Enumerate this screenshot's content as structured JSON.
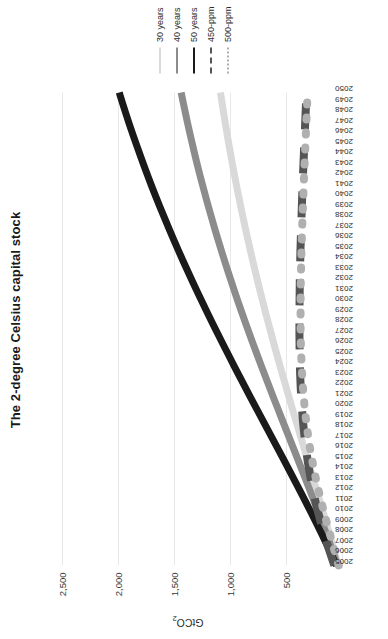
{
  "chart_data": {
    "type": "line",
    "title": "The 2-degree Celsius capital stock",
    "xlabel": "",
    "ylabel": "GtCO",
    "ylabel_sub": "2",
    "ylim": [
      0,
      2750
    ],
    "yticks": [
      0,
      500,
      1000,
      1500,
      2000,
      2500
    ],
    "ytick_labels": [
      "",
      "500",
      "1,000",
      "1,500",
      "2,000",
      "2,500"
    ],
    "grid": true,
    "legend_position": "right",
    "x": [
      2005,
      2006,
      2007,
      2008,
      2009,
      2010,
      2011,
      2012,
      2013,
      2014,
      2015,
      2016,
      2017,
      2018,
      2019,
      2020,
      2021,
      2022,
      2023,
      2024,
      2025,
      2026,
      2027,
      2028,
      2029,
      2030,
      2031,
      2032,
      2033,
      2034,
      2035,
      2036,
      2037,
      2038,
      2039,
      2040,
      2041,
      2042,
      2043,
      2044,
      2045,
      2046,
      2047,
      2048,
      2049,
      2050
    ],
    "xtick_labels": [
      "2005",
      "2006",
      "2007",
      "2008",
      "2009",
      "2010",
      "2011",
      "2012",
      "2013",
      "2014",
      "2015",
      "2016",
      "2017",
      "2018",
      "2019",
      "2020",
      "2021",
      "2022",
      "2023",
      "2024",
      "2025",
      "2026",
      "2027",
      "2028",
      "2029",
      "2030",
      "2031",
      "2032",
      "2033",
      "2034",
      "2035",
      "2036",
      "2037",
      "2038",
      "2039",
      "2040",
      "2041",
      "2042",
      "2043",
      "2044",
      "2045",
      "2046",
      "2047",
      "2048",
      "2049",
      "2050"
    ],
    "series": [
      {
        "name": "30 years",
        "color": "#d9d9d9",
        "style": "solid",
        "values": [
          35,
          60,
          86,
          112,
          139,
          166,
          194,
          222,
          250,
          278,
          306,
          334,
          362,
          390,
          418,
          446,
          473,
          500,
          527,
          554,
          580,
          606,
          631,
          656,
          681,
          705,
          729,
          752,
          775,
          797,
          819,
          840,
          861,
          881,
          901,
          920,
          939,
          957,
          975,
          992,
          1009,
          1025,
          1041,
          1056,
          1071,
          1085
        ]
      },
      {
        "name": "40 years",
        "color": "#8c8c8c",
        "style": "solid",
        "values": [
          40,
          72,
          105,
          139,
          174,
          209,
          245,
          281,
          317,
          354,
          391,
          428,
          465,
          502,
          539,
          576,
          613,
          649,
          685,
          721,
          756,
          791,
          825,
          859,
          892,
          925,
          957,
          988,
          1019,
          1049,
          1078,
          1107,
          1135,
          1162,
          1189,
          1215,
          1240,
          1265,
          1289,
          1312,
          1334,
          1356,
          1377,
          1397,
          1417,
          1436
        ]
      },
      {
        "name": "50 years",
        "color": "#1a1a1a",
        "style": "solid",
        "values": [
          50,
          92,
          136,
          181,
          227,
          274,
          322,
          370,
          419,
          468,
          517,
          567,
          617,
          667,
          717,
          767,
          817,
          866,
          915,
          964,
          1012,
          1060,
          1107,
          1154,
          1200,
          1245,
          1290,
          1334,
          1377,
          1420,
          1462,
          1503,
          1543,
          1582,
          1621,
          1659,
          1696,
          1732,
          1767,
          1801,
          1834,
          1867,
          1899,
          1930,
          1960,
          1989
        ]
      },
      {
        "name": "450-ppm",
        "color": "#555555",
        "style": "dashed",
        "values": [
          68,
          100,
          131,
          160,
          187,
          212,
          235,
          256,
          275,
          292,
          307,
          320,
          332,
          342,
          351,
          358,
          364,
          369,
          373,
          376,
          378,
          379,
          380,
          380,
          380,
          379,
          378,
          377,
          375,
          373,
          371,
          368,
          365,
          362,
          359,
          356,
          352,
          349,
          345,
          341,
          337,
          333,
          329,
          325,
          321,
          317
        ]
      },
      {
        "name": "500-ppm",
        "color": "#b0b0b0",
        "style": "dotted",
        "values": [
          30,
          56,
          82,
          108,
          134,
          159,
          183,
          206,
          228,
          248,
          266,
          283,
          298,
          311,
          323,
          333,
          342,
          349,
          355,
          360,
          364,
          367,
          369,
          370,
          370,
          370,
          369,
          368,
          366,
          364,
          362,
          359,
          356,
          353,
          350,
          346,
          343,
          339,
          335,
          331,
          327,
          323,
          319,
          315,
          311,
          307
        ]
      }
    ]
  }
}
